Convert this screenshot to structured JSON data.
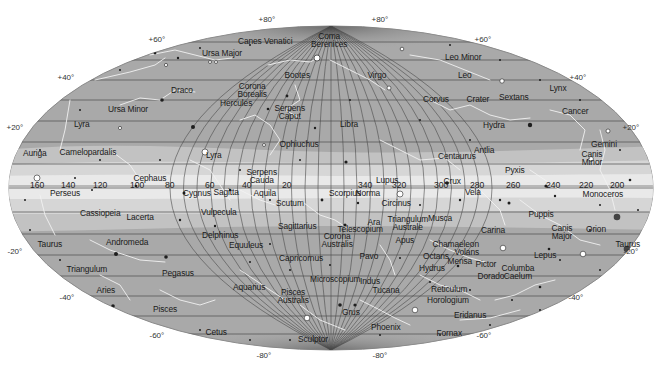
{
  "map": {
    "type": "all-sky star chart",
    "projection": "Aitoff/Hammer ellipse",
    "colors": {
      "background": "#ffffff",
      "sky_fill": "#a9a9a9",
      "milky_way_outer": "#c4c4c4",
      "milky_way_inner": "#dcdcdc",
      "milky_way_core": "#ececec",
      "grid": "#4a4a4a",
      "constellation_lines": "#f2f2f2",
      "stars": "#1e1e1e",
      "text": "#1a1a1a"
    },
    "declination_labels": [
      {
        "text": "+80°",
        "x": 267,
        "y": 20
      },
      {
        "text": "+80°",
        "x": 380,
        "y": 20
      },
      {
        "text": "+60°",
        "x": 157,
        "y": 40
      },
      {
        "text": "+60°",
        "x": 483,
        "y": 40
      },
      {
        "text": "+40°",
        "x": 66,
        "y": 78
      },
      {
        "text": "+40°",
        "x": 578,
        "y": 78
      },
      {
        "text": "+20°",
        "x": 15,
        "y": 128
      },
      {
        "text": "+20°",
        "x": 631,
        "y": 128
      },
      {
        "text": "-20°",
        "x": 15,
        "y": 252
      },
      {
        "text": "-20°",
        "x": 631,
        "y": 252
      },
      {
        "text": "-40°",
        "x": 67,
        "y": 298
      },
      {
        "text": "-40°",
        "x": 576,
        "y": 298
      },
      {
        "text": "-60°",
        "x": 157,
        "y": 336
      },
      {
        "text": "-60°",
        "x": 484,
        "y": 336
      },
      {
        "text": "-80°",
        "x": 264,
        "y": 356
      },
      {
        "text": "-80°",
        "x": 380,
        "y": 356
      }
    ],
    "galactic_longitude_labels": [
      {
        "text": "160",
        "x": 37,
        "y": 185
      },
      {
        "text": "140",
        "x": 68,
        "y": 185
      },
      {
        "text": "120",
        "x": 100,
        "y": 185
      },
      {
        "text": "100",
        "x": 137,
        "y": 185
      },
      {
        "text": "80",
        "x": 170,
        "y": 185
      },
      {
        "text": "60",
        "x": 210,
        "y": 185
      },
      {
        "text": "40",
        "x": 247,
        "y": 185
      },
      {
        "text": "20",
        "x": 287,
        "y": 185
      },
      {
        "text": "340",
        "x": 365,
        "y": 185
      },
      {
        "text": "320",
        "x": 399,
        "y": 185
      },
      {
        "text": "300",
        "x": 441,
        "y": 185
      },
      {
        "text": "280",
        "x": 477,
        "y": 185
      },
      {
        "text": "260",
        "x": 513,
        "y": 185
      },
      {
        "text": "240",
        "x": 553,
        "y": 185
      },
      {
        "text": "220",
        "x": 586,
        "y": 185
      },
      {
        "text": "200",
        "x": 617,
        "y": 185
      }
    ],
    "constellations": [
      {
        "name": "Coma Berenices",
        "x": 329,
        "y": 40,
        "two_line": true
      },
      {
        "name": "Canes Venatici",
        "x": 265,
        "y": 41
      },
      {
        "name": "Ursa Major",
        "x": 222,
        "y": 53
      },
      {
        "name": "Leo Minor",
        "x": 463,
        "y": 57
      },
      {
        "name": "Bootes",
        "x": 297,
        "y": 75
      },
      {
        "name": "Virgo",
        "x": 377,
        "y": 75
      },
      {
        "name": "Leo",
        "x": 465,
        "y": 75
      },
      {
        "name": "Draco",
        "x": 182,
        "y": 90
      },
      {
        "name": "Corona Borealis",
        "x": 252,
        "y": 90,
        "two_line": true
      },
      {
        "name": "Corvus",
        "x": 436,
        "y": 99
      },
      {
        "name": "Crater",
        "x": 478,
        "y": 99
      },
      {
        "name": "Sextans",
        "x": 514,
        "y": 97
      },
      {
        "name": "Lynx",
        "x": 558,
        "y": 88
      },
      {
        "name": "Ursa Minor",
        "x": 128,
        "y": 109
      },
      {
        "name": "Hercules",
        "x": 236,
        "y": 103
      },
      {
        "name": "Serpens Caput",
        "x": 290,
        "y": 112,
        "two_line": true
      },
      {
        "name": "Cancer",
        "x": 575,
        "y": 111
      },
      {
        "name": "Hydra",
        "x": 494,
        "y": 125
      },
      {
        "name": "Lyra",
        "x": 82,
        "y": 124
      },
      {
        "name": "Libra",
        "x": 349,
        "y": 124
      },
      {
        "name": "Gemini",
        "x": 604,
        "y": 144
      },
      {
        "name": "Antlia",
        "x": 484,
        "y": 150
      },
      {
        "name": "Ophiuchus",
        "x": 299,
        "y": 144
      },
      {
        "name": "Canis Minor",
        "x": 592,
        "y": 158,
        "two_line": true
      },
      {
        "name": "Auriga",
        "x": 35,
        "y": 153
      },
      {
        "name": "Camelopardalis",
        "x": 88,
        "y": 152
      },
      {
        "name": "Lyra",
        "x": 214,
        "y": 155
      },
      {
        "name": "Centaurus",
        "x": 457,
        "y": 156
      },
      {
        "name": "Cephaus",
        "x": 150,
        "y": 178
      },
      {
        "name": "Serpens Cauda",
        "x": 262,
        "y": 176,
        "two_line": true
      },
      {
        "name": "Lupus",
        "x": 387,
        "y": 180
      },
      {
        "name": "Pyxis",
        "x": 515,
        "y": 170
      },
      {
        "name": "Crux",
        "x": 452,
        "y": 181
      },
      {
        "name": "Perseus",
        "x": 65,
        "y": 193
      },
      {
        "name": "Cygnus",
        "x": 197,
        "y": 193
      },
      {
        "name": "Sagitta",
        "x": 226,
        "y": 192
      },
      {
        "name": "Aquila",
        "x": 265,
        "y": 193
      },
      {
        "name": "Scorpius",
        "x": 345,
        "y": 193
      },
      {
        "name": "Norma",
        "x": 368,
        "y": 193
      },
      {
        "name": "Vela",
        "x": 473,
        "y": 192
      },
      {
        "name": "Monoceros",
        "x": 603,
        "y": 194
      },
      {
        "name": "Scutum",
        "x": 290,
        "y": 203
      },
      {
        "name": "Circinus",
        "x": 396,
        "y": 203
      },
      {
        "name": "Puppis",
        "x": 541,
        "y": 214
      },
      {
        "name": "Cassiopeia",
        "x": 100,
        "y": 213
      },
      {
        "name": "Vulpecula",
        "x": 219,
        "y": 212
      },
      {
        "name": "Lacerta",
        "x": 140,
        "y": 217
      },
      {
        "name": "Ara",
        "x": 374,
        "y": 222
      },
      {
        "name": "Triangulum Australe",
        "x": 408,
        "y": 223,
        "two_line": true
      },
      {
        "name": "Telescopium",
        "x": 360,
        "y": 229
      },
      {
        "name": "Musca",
        "x": 440,
        "y": 218
      },
      {
        "name": "Sagittarius",
        "x": 297,
        "y": 226
      },
      {
        "name": "Carina",
        "x": 493,
        "y": 230
      },
      {
        "name": "Canis Major",
        "x": 562,
        "y": 232,
        "two_line": true
      },
      {
        "name": "Orion",
        "x": 596,
        "y": 229
      },
      {
        "name": "Corona Australis",
        "x": 337,
        "y": 240,
        "two_line": true
      },
      {
        "name": "Delphinus",
        "x": 220,
        "y": 235
      },
      {
        "name": "Apus",
        "x": 405,
        "y": 240
      },
      {
        "name": "Taurus",
        "x": 628,
        "y": 244
      },
      {
        "name": "Taurus",
        "x": 50,
        "y": 244
      },
      {
        "name": "Andromeda",
        "x": 127,
        "y": 242
      },
      {
        "name": "Equuleus",
        "x": 246,
        "y": 245
      },
      {
        "name": "Chamaeleon",
        "x": 456,
        "y": 244
      },
      {
        "name": "Volans",
        "x": 467,
        "y": 252
      },
      {
        "name": "Lepus",
        "x": 545,
        "y": 255
      },
      {
        "name": "Pavo",
        "x": 369,
        "y": 256
      },
      {
        "name": "Octans",
        "x": 436,
        "y": 256
      },
      {
        "name": "Capricornus",
        "x": 301,
        "y": 258
      },
      {
        "name": "Mensa",
        "x": 460,
        "y": 261
      },
      {
        "name": "Pictor",
        "x": 486,
        "y": 264
      },
      {
        "name": "Hydrus",
        "x": 432,
        "y": 268
      },
      {
        "name": "Columba Caelum",
        "x": 518,
        "y": 272,
        "two_line": true
      },
      {
        "name": "Triangulum",
        "x": 87,
        "y": 269
      },
      {
        "name": "Pegasus",
        "x": 178,
        "y": 273
      },
      {
        "name": "Dorado",
        "x": 491,
        "y": 276
      },
      {
        "name": "Microscopium",
        "x": 335,
        "y": 279
      },
      {
        "name": "Indus",
        "x": 370,
        "y": 281
      },
      {
        "name": "Aquarius",
        "x": 249,
        "y": 287
      },
      {
        "name": "Reticulum",
        "x": 449,
        "y": 289
      },
      {
        "name": "Aries",
        "x": 106,
        "y": 290
      },
      {
        "name": "Tucana",
        "x": 386,
        "y": 290
      },
      {
        "name": "Pisces Australis",
        "x": 293,
        "y": 296,
        "two_line": true
      },
      {
        "name": "Horologium",
        "x": 448,
        "y": 300
      },
      {
        "name": "Grus",
        "x": 351,
        "y": 312
      },
      {
        "name": "Pisces",
        "x": 165,
        "y": 309
      },
      {
        "name": "Eridanus",
        "x": 470,
        "y": 315
      },
      {
        "name": "Phoenix",
        "x": 386,
        "y": 327
      },
      {
        "name": "Cetus",
        "x": 216,
        "y": 332
      },
      {
        "name": "Fornax",
        "x": 449,
        "y": 333
      },
      {
        "name": "Sculptor",
        "x": 313,
        "y": 339
      }
    ]
  }
}
